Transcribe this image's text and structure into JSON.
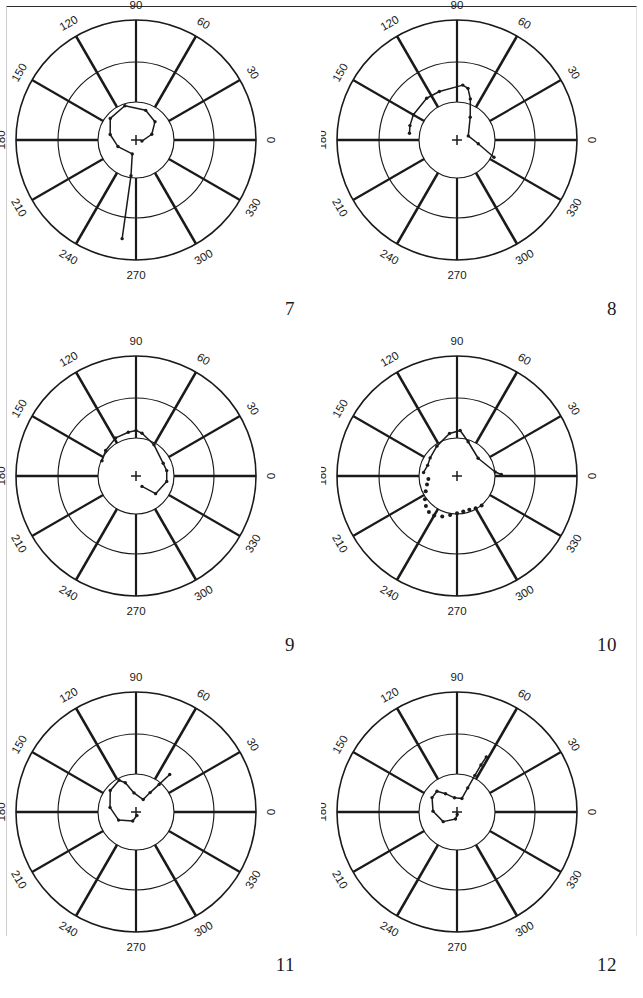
{
  "figure": {
    "type": "polar-plot-grid",
    "rows": 3,
    "cols": 2,
    "background_color": "#ffffff",
    "ink_color": "#1a1a1a",
    "border_top": true
  },
  "chart_data": {
    "type": "scatter",
    "title": "",
    "subtitle": "",
    "xlabel": "",
    "ylabel": "",
    "grid": true,
    "legend_position": "none",
    "coordinate_system": "polar",
    "angle_unit": "degrees",
    "angle_ticks": [
      0,
      30,
      60,
      90,
      120,
      150,
      180,
      210,
      240,
      270,
      300,
      330
    ],
    "radial_rings": 3,
    "radial_ring_radii_px": [
      38,
      78,
      120
    ],
    "center_marker": "plus",
    "panels": [
      {
        "id": 7,
        "label": "7",
        "trace_style": "solid",
        "points_polar": [
          [
            262,
            0.83
          ],
          [
            262,
            0.3
          ],
          [
            255,
            0.12
          ],
          [
            200,
            0.16
          ],
          [
            168,
            0.22
          ],
          [
            140,
            0.28
          ],
          [
            108,
            0.3
          ],
          [
            72,
            0.26
          ],
          [
            44,
            0.22
          ],
          [
            20,
            0.14
          ],
          [
            350,
            0.05
          ]
        ]
      },
      {
        "id": 8,
        "label": "8",
        "trace_style": "solid",
        "points_polar": [
          [
            335,
            0.34
          ],
          [
            350,
            0.18
          ],
          [
            20,
            0.1
          ],
          [
            60,
            0.22
          ],
          [
            72,
            0.36
          ],
          [
            78,
            0.44
          ],
          [
            84,
            0.46
          ],
          [
            110,
            0.43
          ],
          [
            126,
            0.43
          ],
          [
            150,
            0.42
          ],
          [
            163,
            0.41
          ],
          [
            172,
            0.4
          ]
        ]
      },
      {
        "id": 9,
        "label": "9",
        "trace_style": "solid",
        "points_polar": [
          [
            300,
            0.1
          ],
          [
            318,
            0.22
          ],
          [
            350,
            0.26
          ],
          [
            10,
            0.26
          ],
          [
            25,
            0.25
          ],
          [
            60,
            0.3
          ],
          [
            82,
            0.36
          ],
          [
            90,
            0.38
          ],
          [
            100,
            0.37
          ],
          [
            118,
            0.36
          ],
          [
            140,
            0.33
          ],
          [
            156,
            0.31
          ]
        ]
      },
      {
        "id": 10,
        "label": "10",
        "trace_style": "solid-and-dotted",
        "points_polar": [
          [
            2,
            0.37
          ],
          [
            6,
            0.32
          ],
          [
            40,
            0.23
          ],
          [
            72,
            0.3
          ],
          [
            86,
            0.38
          ],
          [
            100,
            0.36
          ],
          [
            124,
            0.3
          ],
          [
            146,
            0.27
          ],
          [
            160,
            0.26
          ],
          [
            174,
            0.28
          ]
        ],
        "dotted_points_polar": [
          [
            186,
            0.24
          ],
          [
            196,
            0.26
          ],
          [
            206,
            0.29
          ],
          [
            216,
            0.33
          ],
          [
            224,
            0.36
          ],
          [
            232,
            0.38
          ],
          [
            240,
            0.38
          ],
          [
            250,
            0.36
          ],
          [
            260,
            0.33
          ],
          [
            270,
            0.31
          ],
          [
            280,
            0.3
          ],
          [
            290,
            0.3
          ],
          [
            300,
            0.31
          ],
          [
            310,
            0.32
          ]
        ]
      },
      {
        "id": 11,
        "label": "11",
        "trace_style": "solid",
        "points_polar": [
          [
            48,
            0.42
          ],
          [
            50,
            0.3
          ],
          [
            54,
            0.2
          ],
          [
            60,
            0.12
          ],
          [
            96,
            0.16
          ],
          [
            110,
            0.26
          ],
          [
            118,
            0.3
          ],
          [
            140,
            0.28
          ],
          [
            170,
            0.22
          ],
          [
            205,
            0.16
          ],
          [
            250,
            0.08
          ],
          [
            285,
            0.03
          ]
        ]
      },
      {
        "id": 12,
        "label": "12",
        "trace_style": "solid",
        "points_polar": [
          [
            62,
            0.52
          ],
          [
            63,
            0.44
          ],
          [
            64,
            0.34
          ],
          [
            66,
            0.22
          ],
          [
            70,
            0.12
          ],
          [
            100,
            0.12
          ],
          [
            122,
            0.18
          ],
          [
            134,
            0.24
          ],
          [
            150,
            0.24
          ],
          [
            178,
            0.2
          ],
          [
            215,
            0.14
          ],
          [
            258,
            0.06
          ],
          [
            275,
            0.02
          ]
        ]
      }
    ]
  }
}
